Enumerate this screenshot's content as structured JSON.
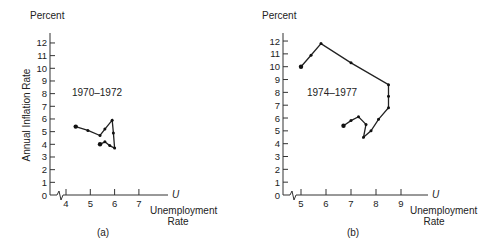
{
  "chart_data": [
    {
      "type": "line",
      "panel_label": "(a)",
      "annotation": "1970–1972",
      "y_unit_label": "Percent",
      "ylabel": "Annual Inflation Rate",
      "xlabel": "Unemployment Rate",
      "x_axis_symbol": "U",
      "x_ticks": [
        "4",
        "5",
        "6",
        "7"
      ],
      "y_ticks": [
        "0",
        "1",
        "2",
        "3",
        "4",
        "5",
        "6",
        "7",
        "8",
        "9",
        "10",
        "11",
        "12"
      ],
      "xlim": [
        3.3,
        8.0
      ],
      "ylim": [
        0,
        12.5
      ],
      "axis_break": true,
      "grid": false,
      "series": [
        {
          "name": "1970-1972",
          "x": [
            4.4,
            4.9,
            5.4,
            5.6,
            5.9,
            5.95,
            6.0,
            5.8,
            5.6,
            5.4
          ],
          "y": [
            5.4,
            5.1,
            4.7,
            5.2,
            5.9,
            4.9,
            3.7,
            3.9,
            4.2,
            4.0
          ]
        }
      ]
    },
    {
      "type": "line",
      "panel_label": "(b)",
      "annotation": "1974–1977",
      "y_unit_label": "Percent",
      "ylabel": "",
      "xlabel": "Unemployment Rate",
      "x_axis_symbol": "U",
      "x_ticks": [
        "5",
        "6",
        "7",
        "8",
        "9"
      ],
      "y_ticks": [
        "0",
        "1",
        "2",
        "3",
        "4",
        "5",
        "6",
        "7",
        "8",
        "9",
        "10",
        "11",
        "12"
      ],
      "xlim": [
        4.3,
        10.3
      ],
      "ylim": [
        0,
        12.5
      ],
      "axis_break": true,
      "grid": false,
      "series": [
        {
          "name": "1974-1977",
          "x": [
            5.0,
            5.4,
            5.8,
            7.0,
            8.5,
            8.5,
            8.5,
            8.1,
            7.8,
            7.5,
            7.6,
            7.3,
            7.0,
            6.7
          ],
          "y": [
            10.0,
            10.9,
            11.8,
            10.3,
            8.6,
            7.7,
            6.8,
            5.9,
            5.0,
            4.5,
            5.5,
            6.1,
            5.8,
            5.4
          ]
        }
      ]
    }
  ]
}
